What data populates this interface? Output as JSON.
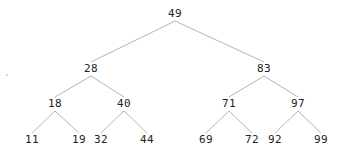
{
  "diagram": {
    "type": "binary-search-tree",
    "edge_color": "#b5b5b5",
    "text_color": "#222222",
    "nodes": [
      {
        "id": "n49",
        "label": "49",
        "x": 175,
        "y": 14
      },
      {
        "id": "n28",
        "label": "28",
        "x": 91,
        "y": 69
      },
      {
        "id": "n83",
        "label": "83",
        "x": 264,
        "y": 69
      },
      {
        "id": "n18",
        "label": "18",
        "x": 55,
        "y": 104
      },
      {
        "id": "n40",
        "label": "40",
        "x": 124,
        "y": 104
      },
      {
        "id": "n71",
        "label": "71",
        "x": 229,
        "y": 104
      },
      {
        "id": "n97",
        "label": "97",
        "x": 298,
        "y": 104
      },
      {
        "id": "n11",
        "label": "11",
        "x": 32,
        "y": 140
      },
      {
        "id": "n19",
        "label": "19",
        "x": 79,
        "y": 140
      },
      {
        "id": "n32",
        "label": "32",
        "x": 101,
        "y": 140
      },
      {
        "id": "n44",
        "label": "44",
        "x": 147,
        "y": 140
      },
      {
        "id": "n69",
        "label": "69",
        "x": 206,
        "y": 140
      },
      {
        "id": "n72",
        "label": "72",
        "x": 252,
        "y": 140
      },
      {
        "id": "n92",
        "label": "92",
        "x": 275,
        "y": 140
      },
      {
        "id": "n99",
        "label": "99",
        "x": 321,
        "y": 140
      }
    ],
    "edges": [
      [
        "n49",
        "n28"
      ],
      [
        "n49",
        "n83"
      ],
      [
        "n28",
        "n18"
      ],
      [
        "n28",
        "n40"
      ],
      [
        "n83",
        "n71"
      ],
      [
        "n83",
        "n97"
      ],
      [
        "n18",
        "n11"
      ],
      [
        "n18",
        "n19"
      ],
      [
        "n40",
        "n32"
      ],
      [
        "n40",
        "n44"
      ],
      [
        "n71",
        "n69"
      ],
      [
        "n71",
        "n72"
      ],
      [
        "n97",
        "n92"
      ],
      [
        "n97",
        "n99"
      ]
    ]
  }
}
